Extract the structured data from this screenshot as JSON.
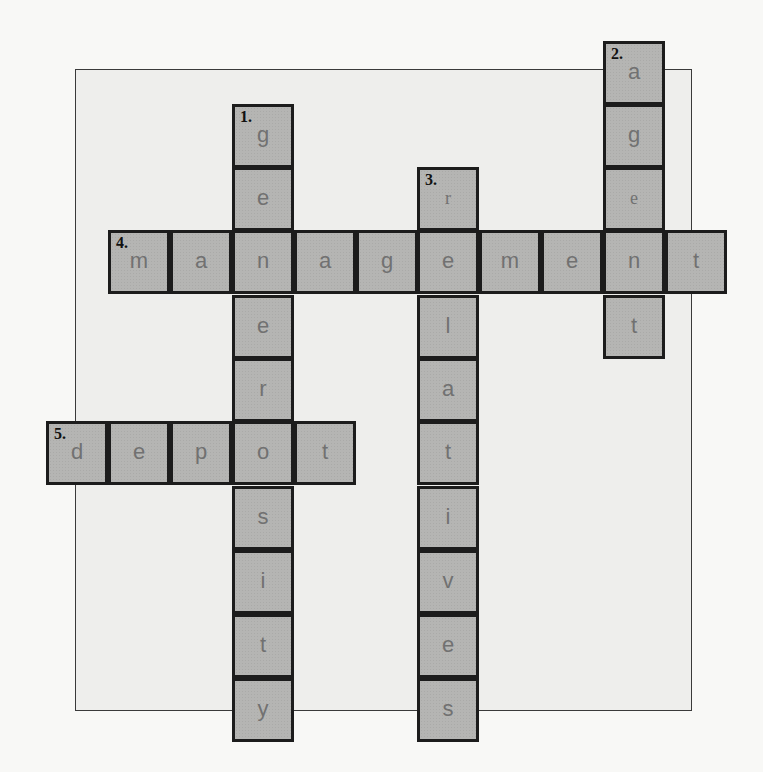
{
  "puzzle": {
    "type": "crossword",
    "colors": {
      "page_bg": "#f8f8f6",
      "panel_bg": "#eeeeec",
      "cell_fill": "#b5b5b3",
      "cell_border": "#1c1c1c",
      "letter": "#717171",
      "number": "#111111"
    },
    "words": [
      {
        "number": "1.",
        "direction": "down",
        "answer": "generosity"
      },
      {
        "number": "2.",
        "direction": "down",
        "answer": "agent"
      },
      {
        "number": "3.",
        "direction": "down",
        "answer": "relatives"
      },
      {
        "number": "4.",
        "direction": "across",
        "answer": "management"
      },
      {
        "number": "5.",
        "direction": "across",
        "answer": "depot"
      }
    ],
    "cells": [
      {
        "col": 9,
        "row": 0,
        "letter": "a",
        "num": "2."
      },
      {
        "col": 3,
        "row": 1,
        "letter": "g",
        "num": "1."
      },
      {
        "col": 9,
        "row": 1,
        "letter": "g"
      },
      {
        "col": 3,
        "row": 2,
        "letter": "e"
      },
      {
        "col": 6,
        "row": 2,
        "letter": "r",
        "num": "3.",
        "serif": true
      },
      {
        "col": 9,
        "row": 2,
        "letter": "e",
        "serif": true
      },
      {
        "col": 1,
        "row": 3,
        "letter": "m",
        "num": "4."
      },
      {
        "col": 2,
        "row": 3,
        "letter": "a"
      },
      {
        "col": 3,
        "row": 3,
        "letter": "n"
      },
      {
        "col": 4,
        "row": 3,
        "letter": "a"
      },
      {
        "col": 5,
        "row": 3,
        "letter": "g"
      },
      {
        "col": 6,
        "row": 3,
        "letter": "e"
      },
      {
        "col": 7,
        "row": 3,
        "letter": "m"
      },
      {
        "col": 8,
        "row": 3,
        "letter": "e"
      },
      {
        "col": 9,
        "row": 3,
        "letter": "n"
      },
      {
        "col": 10,
        "row": 3,
        "letter": "t"
      },
      {
        "col": 3,
        "row": 4,
        "letter": "e"
      },
      {
        "col": 6,
        "row": 4,
        "letter": "l"
      },
      {
        "col": 9,
        "row": 4,
        "letter": "t"
      },
      {
        "col": 3,
        "row": 5,
        "letter": "r"
      },
      {
        "col": 6,
        "row": 5,
        "letter": "a"
      },
      {
        "col": 0,
        "row": 6,
        "letter": "d",
        "num": "5."
      },
      {
        "col": 1,
        "row": 6,
        "letter": "e"
      },
      {
        "col": 2,
        "row": 6,
        "letter": "p"
      },
      {
        "col": 3,
        "row": 6,
        "letter": "o"
      },
      {
        "col": 4,
        "row": 6,
        "letter": "t"
      },
      {
        "col": 6,
        "row": 6,
        "letter": "t"
      },
      {
        "col": 3,
        "row": 7,
        "letter": "s"
      },
      {
        "col": 6,
        "row": 7,
        "letter": "i"
      },
      {
        "col": 3,
        "row": 8,
        "letter": "i"
      },
      {
        "col": 6,
        "row": 8,
        "letter": "v"
      },
      {
        "col": 3,
        "row": 9,
        "letter": "t"
      },
      {
        "col": 6,
        "row": 9,
        "letter": "e"
      },
      {
        "col": 3,
        "row": 10,
        "letter": "y"
      },
      {
        "col": 6,
        "row": 10,
        "letter": "s"
      }
    ]
  }
}
